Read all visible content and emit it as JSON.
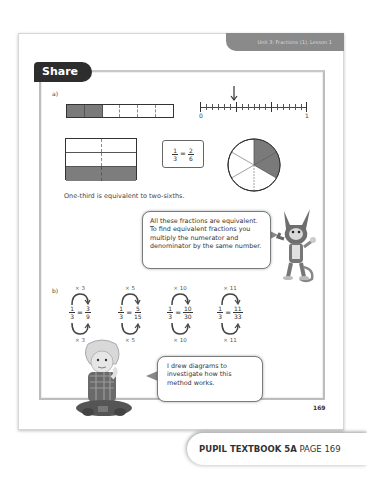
{
  "header": {
    "unit_label": "Unit 3: Fractions (1), Lesson 1",
    "section_title": "Share"
  },
  "part_a": {
    "label": "a)",
    "bar_model": {
      "total_parts": 6,
      "shaded_parts": 2
    },
    "number_line": {
      "start_label": "0",
      "end_label": "1",
      "divisions": 18,
      "arrow_at": "1/3"
    },
    "rectangle_model": {
      "rows": 3,
      "cols": 2,
      "shaded_rows": 1
    },
    "fraction_box": {
      "left_num": "1",
      "left_den": "3",
      "right_num": "2",
      "right_den": "6",
      "equals": "="
    },
    "pie_model": {
      "total_parts": 6,
      "shaded_parts": 2
    },
    "sentence": "One-third is equivalent to two-sixths."
  },
  "bubble_cat": {
    "text": "All these fractions are equivalent. To find equivalent fractions you multiply the numerator and denominator by the same number."
  },
  "part_b": {
    "label": "b)",
    "equations": [
      {
        "op_top": "× 3",
        "op_bottom": "× 3",
        "left_num": "1",
        "left_den": "3",
        "right_num": "3",
        "right_den": "9"
      },
      {
        "op_top": "× 5",
        "op_bottom": "× 5",
        "left_num": "1",
        "left_den": "3",
        "right_num": "5",
        "right_den": "15"
      },
      {
        "op_top": "× 10",
        "op_bottom": "× 10",
        "left_num": "1",
        "left_den": "3",
        "right_num": "10",
        "right_den": "30"
      },
      {
        "op_top": "× 11",
        "op_bottom": "× 11",
        "left_num": "1",
        "left_den": "3",
        "right_num": "11",
        "right_den": "33"
      }
    ],
    "equals": "="
  },
  "bubble_boy": {
    "text": "I drew diagrams to investigate how this method works."
  },
  "page_number": "169",
  "footer": {
    "book": "PUPIL TEXTBOOK 5A",
    "page": "PAGE 169"
  },
  "colors": {
    "shade": "#7a7a7a",
    "tab_dark": "#2d2d2d",
    "unit_tab": "#8a8a8a"
  }
}
